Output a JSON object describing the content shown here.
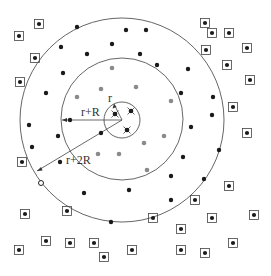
{
  "diagram": {
    "labels": {
      "inner_radius": "r",
      "middle_radius": "r+R",
      "outer_radius": "r+2R"
    },
    "legend_semantics": {
      "center_nodes": "crossed black dots inside inner circle (radius r)",
      "gray_nodes": "gray dots within ring r+R",
      "black_nodes": "black dots within ring r+2R",
      "boxed_nodes": "boxed black dots outside r+2R",
      "open_node": "hollow dot on r+2R boundary"
    },
    "colors": {
      "black_node": "#1a1a1a",
      "gray_node": "#8a8a8a",
      "line": "#555555"
    },
    "node_counts": {
      "center": 3,
      "gray": 10,
      "black": 29,
      "boxed": 29,
      "open": 1
    }
  }
}
